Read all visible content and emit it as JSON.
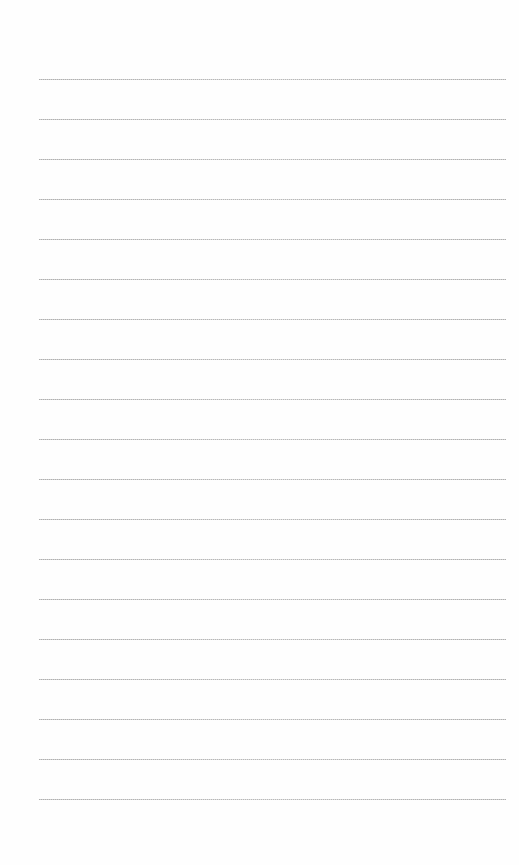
{
  "paper": {
    "background": "#fefefe",
    "line_color": "#b4b4b4",
    "line_count": 19,
    "first_line_y": 79,
    "line_spacing": 40,
    "line_left": 39,
    "line_right": 506
  }
}
